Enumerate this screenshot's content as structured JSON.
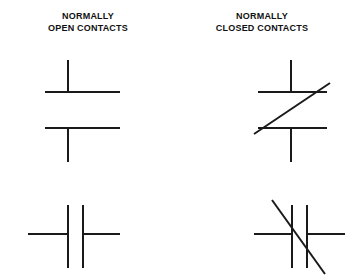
{
  "page": {
    "background_color": "#ffffff",
    "line_color": "#1a1a1a",
    "width": 346,
    "height": 279
  },
  "columns": [
    {
      "id": "normally-open",
      "label_line1": "NORMALLY",
      "label_line2": "OPEN CONTACTS",
      "label_text": "NORMALLY\nOPEN CONTACTS"
    },
    {
      "id": "normally-closed",
      "label_line1": "NORMALLY",
      "label_line2": "CLOSED CONTACTS",
      "label_text": "NORMALLY\nCLOSED CONTACTS"
    }
  ],
  "symbols": [
    {
      "id": "no-vertical",
      "name": "normally-open-vertical-contact",
      "column": "normally-open",
      "orientation": "vertical",
      "has_slash": false,
      "lines": [
        {
          "name": "upper-lead",
          "x1": 68,
          "y1": 60,
          "x2": 68,
          "y2": 92
        },
        {
          "name": "upper-plate",
          "x1": 45,
          "y1": 92,
          "x2": 120,
          "y2": 92
        },
        {
          "name": "lower-plate",
          "x1": 45,
          "y1": 128,
          "x2": 120,
          "y2": 128
        },
        {
          "name": "lower-lead",
          "x1": 68,
          "y1": 128,
          "x2": 68,
          "y2": 162
        }
      ]
    },
    {
      "id": "nc-vertical",
      "name": "normally-closed-vertical-contact",
      "column": "normally-closed",
      "orientation": "vertical",
      "has_slash": true,
      "lines": [
        {
          "name": "upper-lead",
          "x1": 291,
          "y1": 60,
          "x2": 291,
          "y2": 92
        },
        {
          "name": "upper-plate",
          "x1": 258,
          "y1": 92,
          "x2": 327,
          "y2": 92
        },
        {
          "name": "lower-plate",
          "x1": 258,
          "y1": 128,
          "x2": 327,
          "y2": 128
        },
        {
          "name": "lower-lead",
          "x1": 291,
          "y1": 128,
          "x2": 291,
          "y2": 162
        }
      ],
      "slash": {
        "name": "diagonal-slash",
        "x1": 254,
        "y1": 134,
        "x2": 330,
        "y2": 83
      }
    },
    {
      "id": "no-horizontal",
      "name": "normally-open-horizontal-contact",
      "column": "normally-open",
      "orientation": "horizontal",
      "has_slash": false,
      "lines": [
        {
          "name": "left-lead",
          "x1": 28,
          "y1": 234,
          "x2": 68,
          "y2": 234
        },
        {
          "name": "left-plate",
          "x1": 68,
          "y1": 205,
          "x2": 68,
          "y2": 268
        },
        {
          "name": "right-plate",
          "x1": 83,
          "y1": 205,
          "x2": 83,
          "y2": 268
        },
        {
          "name": "right-lead",
          "x1": 83,
          "y1": 234,
          "x2": 120,
          "y2": 234
        }
      ]
    },
    {
      "id": "nc-horizontal",
      "name": "normally-closed-horizontal-contact",
      "column": "normally-closed",
      "orientation": "horizontal",
      "has_slash": true,
      "lines": [
        {
          "name": "left-lead",
          "x1": 254,
          "y1": 234,
          "x2": 292,
          "y2": 234
        },
        {
          "name": "left-plate",
          "x1": 292,
          "y1": 205,
          "x2": 292,
          "y2": 268
        },
        {
          "name": "right-plate",
          "x1": 307,
          "y1": 205,
          "x2": 307,
          "y2": 268
        },
        {
          "name": "right-lead",
          "x1": 307,
          "y1": 234,
          "x2": 345,
          "y2": 234
        }
      ],
      "slash": {
        "name": "diagonal-slash",
        "x1": 272,
        "y1": 200,
        "x2": 325,
        "y2": 274
      }
    }
  ]
}
